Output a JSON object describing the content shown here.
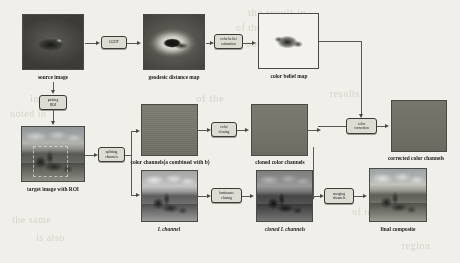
{
  "figure": {
    "background_color": "#f1efe9",
    "line_color": "#5b5953",
    "box_fill": "#dedbd3"
  },
  "nodes": [
    {
      "id": "source_image",
      "label": "source image",
      "italic": false
    },
    {
      "id": "geodesic_distance_map",
      "label": "geodesic distance map",
      "italic": false
    },
    {
      "id": "color_belief_map",
      "label": "color belief map",
      "italic": false
    },
    {
      "id": "target_image_with_roi",
      "label": "target image with ROI",
      "italic": false
    },
    {
      "id": "color_channels",
      "label": "color channels(a combined with b)",
      "italic": false
    },
    {
      "id": "cloned_color_channels",
      "label": "cloned color channels",
      "italic": false
    },
    {
      "id": "corrected_color_channels",
      "label": "corrected color channels",
      "italic": false
    },
    {
      "id": "l_channel",
      "label": "L channel",
      "italic": true
    },
    {
      "id": "cloned_l_channels",
      "label": "cloned L channels",
      "italic": true
    },
    {
      "id": "final_composite",
      "label": "final composite",
      "italic": false
    }
  ],
  "processes": [
    {
      "id": "ggdt",
      "lines": [
        "GGDT"
      ]
    },
    {
      "id": "color_belief_est",
      "lines": [
        "color belief",
        "estimation"
      ]
    },
    {
      "id": "pasting_roi",
      "lines": [
        "pasting",
        "ROI"
      ]
    },
    {
      "id": "splitting_channels",
      "lines": [
        "splitting",
        "channels"
      ]
    },
    {
      "id": "color_cloning",
      "lines": [
        "color",
        "cloning"
      ]
    },
    {
      "id": "color_correction",
      "lines": [
        "color",
        "correction"
      ]
    },
    {
      "id": "luminance_cloning",
      "lines": [
        "luminance",
        "cloning"
      ]
    },
    {
      "id": "merging_channels",
      "lines": [
        "merging",
        "channels"
      ]
    }
  ],
  "background_text": [
    {
      "text": "the result in",
      "x": 248,
      "y": 6,
      "size": 11
    },
    {
      "text": "of the image as a",
      "x": 236,
      "y": 22,
      "size": 10
    },
    {
      "text": "obtained by",
      "x": 246,
      "y": 38,
      "size": 10
    },
    {
      "text": "in the",
      "x": 30,
      "y": 92,
      "size": 11
    },
    {
      "text": "noted in",
      "x": 10,
      "y": 108,
      "size": 10
    },
    {
      "text": "of the",
      "x": 196,
      "y": 92,
      "size": 11
    },
    {
      "text": "results",
      "x": 330,
      "y": 88,
      "size": 10
    },
    {
      "text": "the same",
      "x": 12,
      "y": 214,
      "size": 10
    },
    {
      "text": "is also",
      "x": 36,
      "y": 232,
      "size": 10
    },
    {
      "text": "of image",
      "x": 352,
      "y": 206,
      "size": 10
    },
    {
      "text": "region",
      "x": 402,
      "y": 240,
      "size": 10
    }
  ]
}
